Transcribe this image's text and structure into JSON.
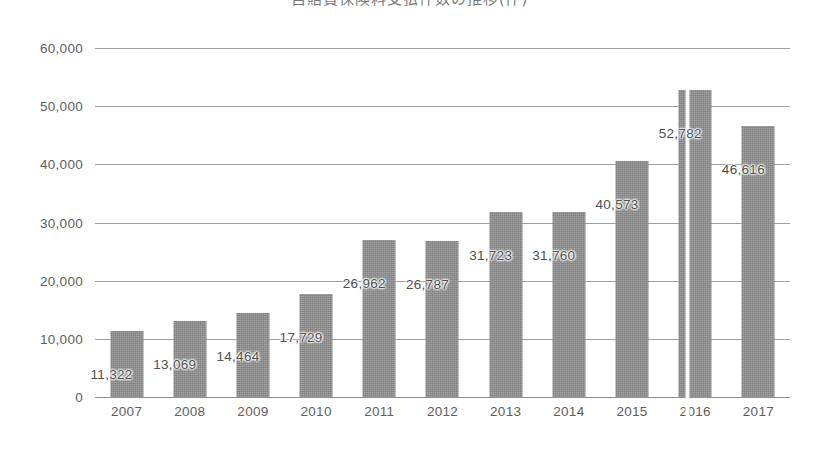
{
  "chart_data": {
    "type": "bar",
    "title": "自賠責保険料支払件数の推移(件)",
    "title_note": "title-clipped-at-top-edge",
    "xlabel": "",
    "ylabel": "",
    "categories": [
      "2007",
      "2008",
      "2009",
      "2010",
      "2011",
      "2012",
      "2013",
      "2014",
      "2015",
      "2016",
      "2017"
    ],
    "values": [
      11322,
      13069,
      14464,
      17729,
      26962,
      26787,
      31723,
      31760,
      40573,
      52782,
      46616
    ],
    "data_labels": [
      "11,322",
      "13,069",
      "14,464",
      "17,729",
      "26,962",
      "26,787",
      "31,723",
      "31,760",
      "40,573",
      "52,782",
      "46,616"
    ],
    "ylim": [
      0,
      60000
    ],
    "ytick_values": [
      0,
      10000,
      20000,
      30000,
      40000,
      50000,
      60000
    ],
    "ytick_labels": [
      "0",
      "10,000",
      "20,000",
      "30,000",
      "40,000",
      "50,000",
      "60,000"
    ],
    "grid": true,
    "legend": false,
    "legend_position": "none",
    "series": [
      {
        "name": "件数",
        "values": [
          11322,
          13069,
          14464,
          17729,
          26962,
          26787,
          31723,
          31760,
          40573,
          52782,
          46616
        ]
      }
    ]
  },
  "style": {
    "bar_color": "#8d8d8d",
    "grid_color": "#8f8f8f",
    "axis_text_color": "#5e5e5e",
    "label_text_color": "#4f4f4f",
    "background": "#ffffff"
  }
}
